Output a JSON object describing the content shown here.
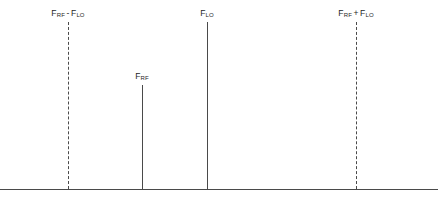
{
  "figure": {
    "title": "",
    "background_color": "#ffffff",
    "line_color": "#4a4a4a",
    "text_color": "#1e1e1e",
    "width": 438,
    "height": 213
  },
  "axis": {
    "name": "frequency-axis",
    "baseline_y": 189,
    "x_start": 0,
    "x_end": 438,
    "style": "solid"
  },
  "chart_data": {
    "type": "bar",
    "title": "",
    "xlabel": "",
    "ylabel": "",
    "grid": false,
    "legend": null,
    "categories": [
      "F_RF - F_LO",
      "F_RF",
      "F_LO",
      "F_RF + F_LO"
    ],
    "values": [
      167,
      104,
      167,
      167
    ],
    "x_positions": [
      68,
      142,
      207,
      356
    ],
    "line_styles": [
      "dashed",
      "solid",
      "solid",
      "dashed"
    ],
    "annotations": [
      "Mixer output spectrum: difference product, RF feedthrough, LO feedthrough, sum product"
    ]
  },
  "lines": [
    {
      "id": "difference-product",
      "label_prefix": "F",
      "label_sub1": "RF",
      "label_operator": "-",
      "label_base2": "F",
      "label_sub2": "LO",
      "x": 68,
      "top": 22,
      "bottom": 189,
      "style": "dashed",
      "label_x": 68,
      "label_y": 8
    },
    {
      "id": "rf-feedthrough",
      "label_prefix": "F",
      "label_sub1": "RF",
      "label_operator": "",
      "label_base2": "",
      "label_sub2": "",
      "x": 142,
      "top": 85,
      "bottom": 189,
      "style": "solid",
      "label_x": 142,
      "label_y": 71
    },
    {
      "id": "lo-feedthrough",
      "label_prefix": "F",
      "label_sub1": "LO",
      "label_operator": "",
      "label_base2": "",
      "label_sub2": "",
      "x": 207,
      "top": 22,
      "bottom": 189,
      "style": "solid",
      "label_x": 207,
      "label_y": 8
    },
    {
      "id": "sum-product",
      "label_prefix": "F",
      "label_sub1": "RF",
      "label_operator": "+",
      "label_base2": "F",
      "label_sub2": "LO",
      "x": 356,
      "top": 22,
      "bottom": 189,
      "style": "dashed",
      "label_x": 356,
      "label_y": 8
    }
  ]
}
